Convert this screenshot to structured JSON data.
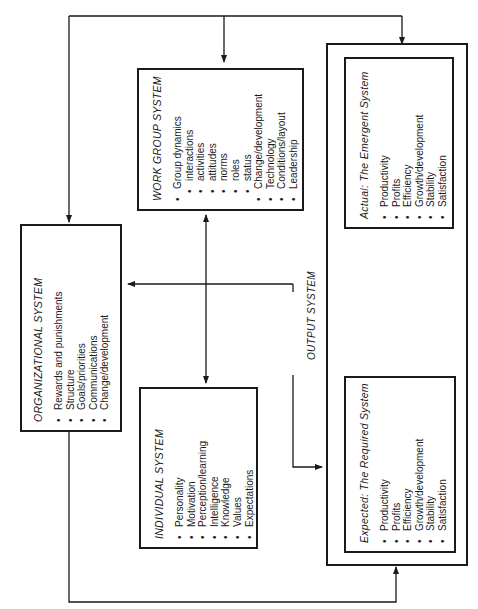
{
  "diagram": {
    "orientation": "rotated-90-ccw",
    "line_color": "#1a1a1a",
    "organizational": {
      "title": "ORGANIZATIONAL SYSTEM",
      "items": [
        "Rewards and punishments",
        "Structure",
        "Goals/priorities",
        "Communications",
        "Change/development"
      ]
    },
    "work_group": {
      "title": "WORK GROUP SYSTEM",
      "items": [
        {
          "text": "Group dynamics",
          "level": 0
        },
        {
          "text": "interactions",
          "level": 1
        },
        {
          "text": "activities",
          "level": 1
        },
        {
          "text": "attitudes",
          "level": 1
        },
        {
          "text": "norms",
          "level": 1
        },
        {
          "text": "roles",
          "level": 1
        },
        {
          "text": "status",
          "level": 1
        },
        {
          "text": "Change/development",
          "level": 0
        },
        {
          "text": "Technology",
          "level": 0
        },
        {
          "text": "Conditions/layout",
          "level": 0
        },
        {
          "text": "Leadership",
          "level": 0
        }
      ]
    },
    "individual": {
      "title": "INDIVIDUAL SYSTEM",
      "items": [
        "Personality",
        "Motivation",
        "Perception/learning",
        "Intelligence",
        "Knowledge",
        "Values",
        "Expectations"
      ]
    },
    "output": {
      "label": "OUTPUT SYSTEM",
      "emergent": {
        "title": "Actual:  The Emergent System",
        "items": [
          "Productivity",
          "Profits",
          "Efficiency",
          "Growth/development",
          "Stability",
          "Satisfaction"
        ]
      },
      "required": {
        "title": "Expected:  The Required System",
        "items": [
          "Productivity",
          "Profits",
          "Efficiency",
          "Growth/development",
          "Stability",
          "Satisfaction"
        ]
      }
    },
    "connections": [
      {
        "from": "top-bus",
        "to": "organizational",
        "arrow": true
      },
      {
        "from": "top-bus",
        "to": "work_group",
        "arrow": true
      },
      {
        "from": "top-bus",
        "to": "output",
        "arrow": true
      },
      {
        "from": "work_group",
        "to": "individual",
        "arrow": "both"
      },
      {
        "from": "output",
        "to": "organizational",
        "arrow": true
      },
      {
        "from": "organizational",
        "to": "required",
        "arrow": true
      },
      {
        "from": "work_group-individual-line",
        "to": "required",
        "arrow": true
      },
      {
        "from": "required",
        "to": "emergent",
        "arrow": true
      }
    ]
  }
}
